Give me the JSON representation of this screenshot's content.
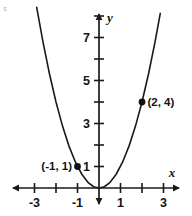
{
  "figure": {
    "corner_mark": "s",
    "background_color": "#ffffff",
    "ink_color": "#1a1a1a"
  },
  "chart_data": {
    "type": "line",
    "title": "",
    "subtitle": "",
    "xlabel": "x",
    "ylabel": "y",
    "grid": false,
    "legend": null,
    "xlim": [
      -4.1,
      4.1
    ],
    "ylim": [
      -1.1,
      8.4
    ],
    "x_ticks": [
      -4,
      -3,
      -2,
      -1,
      0,
      1,
      2,
      3,
      4
    ],
    "y_ticks": [
      -1,
      1,
      2,
      3,
      4,
      5,
      6,
      7,
      8
    ],
    "x_tick_labels": [
      {
        "value": -3,
        "text": "-3"
      },
      {
        "value": -1,
        "text": "-1"
      },
      {
        "value": 1,
        "text": "1"
      },
      {
        "value": 3,
        "text": "3"
      }
    ],
    "y_tick_labels": [
      {
        "value": 1,
        "text": "1"
      },
      {
        "value": 3,
        "text": "3"
      },
      {
        "value": 5,
        "text": "5"
      },
      {
        "value": 7,
        "text": "7"
      }
    ],
    "series": [
      {
        "name": "y = x^2",
        "equation": "y = x^2",
        "x": [
          -2.9,
          -2.6,
          -2.3,
          -2.0,
          -1.7,
          -1.4,
          -1.1,
          -0.8,
          -0.5,
          -0.25,
          0,
          0.25,
          0.5,
          0.8,
          1.1,
          1.4,
          1.7,
          2.0,
          2.3,
          2.6,
          2.85
        ],
        "values": [
          8.41,
          6.76,
          5.29,
          4.0,
          2.89,
          1.96,
          1.21,
          0.64,
          0.25,
          0.0625,
          0,
          0.0625,
          0.25,
          0.64,
          1.21,
          1.96,
          2.89,
          4.0,
          5.29,
          6.76,
          8.12
        ]
      }
    ],
    "annotations": [
      {
        "label": "(-1, 1)",
        "x": -1,
        "y": 1,
        "text_side": "left"
      },
      {
        "label": "(2, 4)",
        "x": 2,
        "y": 4,
        "text_side": "right"
      }
    ]
  }
}
